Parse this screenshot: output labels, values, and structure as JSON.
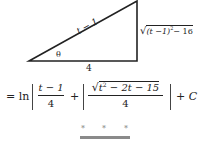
{
  "triangle": {
    "hypotenuse_label": "t − 1",
    "adjacent_label": "4",
    "opposite_label": "√((t − 1)² − 16)",
    "opposite_radicand": "(t −1)",
    "opposite_exp": "2",
    "opposite_tail": "− 16",
    "angle_label": "θ"
  },
  "equation": {
    "prefix": "= ln",
    "term1_numerator": "t − 1",
    "term1_denominator": "4",
    "plus": "+",
    "term2_numerator_radicand": "t",
    "term2_numerator_exp": "2",
    "term2_numerator_tail": " − 2t − 15",
    "term2_denominator": "4",
    "suffix": "+ C"
  },
  "separator": {
    "stars": [
      "*",
      "*",
      "*"
    ],
    "bar_color": "#8a8a8a"
  }
}
